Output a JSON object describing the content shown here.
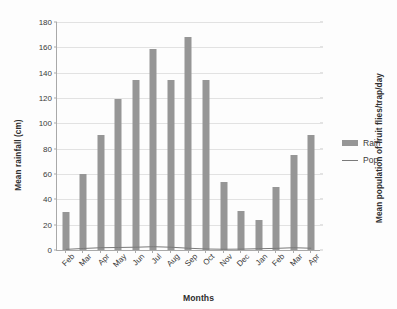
{
  "chart_data": {
    "type": "bar",
    "title": "",
    "xlabel": "Months",
    "ylabel": "Mean rainfall (cm)",
    "y2label": "Mean population of fruit flies/trap/day",
    "categories": [
      "Feb",
      "Mar",
      "Apr",
      "May",
      "Jun",
      "Jul",
      "Aug",
      "Sep",
      "Oct",
      "Nov",
      "Dec",
      "Jan",
      "Feb",
      "Mar",
      "Apr"
    ],
    "series": [
      {
        "name": "Rain",
        "kind": "bar",
        "axis": "left",
        "color": "#969696",
        "values": [
          30,
          60,
          91,
          119,
          134,
          159,
          134,
          168.5,
          134,
          54,
          31,
          24,
          50,
          75,
          91
        ]
      },
      {
        "name": "Pop",
        "kind": "line",
        "axis": "right",
        "color": "#7a7a7a",
        "values": [
          0.5,
          1.2,
          1.8,
          2.0,
          2.2,
          2.6,
          2.2,
          1.4,
          0.8,
          0.6,
          0.7,
          1.0,
          1.3,
          1.8,
          1.4
        ]
      }
    ],
    "ylim": [
      0,
      180
    ],
    "yticks": [
      0,
      20,
      40,
      60,
      80,
      100,
      120,
      140,
      160,
      180
    ],
    "ytick_labels": [
      "0",
      "20",
      "40",
      "60",
      "80",
      "100",
      "120",
      "140",
      "160",
      "180"
    ],
    "grid": true,
    "legend_position": "right"
  },
  "legend": {
    "entries": [
      {
        "label": "Rain",
        "marker": "bar-swatch"
      },
      {
        "label": "Pop",
        "marker": "line-swatch"
      }
    ]
  }
}
